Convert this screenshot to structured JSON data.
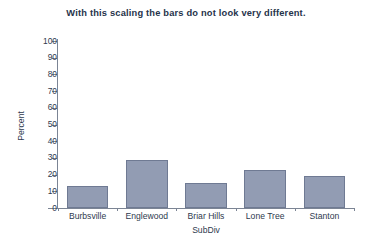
{
  "chart_data": {
    "type": "bar",
    "title": "With this scaling the bars do not look very different.",
    "xlabel": "SubDiv",
    "ylabel": "Percent",
    "categories": [
      "Burbsville",
      "Englewood",
      "Briar Hills",
      "Lone Tree",
      "Stanton"
    ],
    "values": [
      13,
      29,
      15,
      23,
      19
    ],
    "ylim": [
      0,
      100
    ],
    "ytick_labels": [
      "100",
      "90",
      "80",
      "70",
      "60",
      "50",
      "40",
      "30",
      "20",
      "10",
      "0"
    ],
    "ytick_values": [
      100,
      90,
      80,
      70,
      60,
      50,
      40,
      30,
      20,
      10,
      0
    ],
    "grid": false,
    "legend": false,
    "series": [
      {
        "name": "Percent",
        "values": [
          13,
          29,
          15,
          23,
          19
        ]
      }
    ]
  },
  "style": {
    "bar_fill": "#929cb3",
    "bar_border": "#6f7a93",
    "axis_color": "#7b8494",
    "text_color": "#2e3a4e",
    "title_color": "#26334a",
    "background": "#ffffff"
  }
}
